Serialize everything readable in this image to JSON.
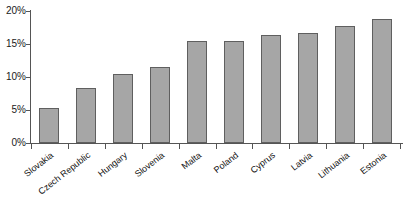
{
  "chart_data": {
    "type": "bar",
    "title": "",
    "xlabel": "",
    "ylabel": "",
    "ylim": [
      0,
      20
    ],
    "ytick_labels": [
      "20%",
      "15%",
      "10%",
      "5%",
      "0%"
    ],
    "ytick_values": [
      20,
      15,
      10,
      5,
      0
    ],
    "grid": false,
    "legend": false,
    "categories": [
      "Slovakia",
      "Czech Republic",
      "Hungary",
      "Slovenia",
      "Malta",
      "Poland",
      "Cyprus",
      "Latvia",
      "Lithuania",
      "Estonia"
    ],
    "values": [
      5.3,
      8.3,
      10.4,
      11.5,
      15.4,
      15.5,
      16.4,
      16.7,
      17.8,
      18.8
    ],
    "value_unit": "%",
    "bar_color": "#a6a6a6",
    "bar_border_color": "#5f5f5f",
    "axis_color": "#555555"
  },
  "caption": {
    "text": ""
  }
}
